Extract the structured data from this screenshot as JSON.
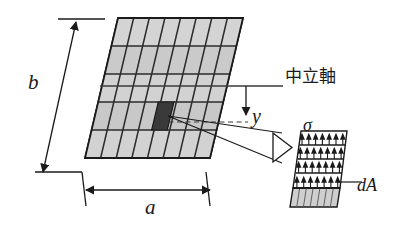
{
  "figure": {
    "labels": {
      "height_dim": "b",
      "width_dim": "a",
      "distance_from_axis": "y",
      "stress_symbol": "σ",
      "area_element": "dA",
      "neutral_axis": "中立軸"
    },
    "colors": {
      "line": "#1a1a1a",
      "grid_fill": "#c9c9c9",
      "grid_fill_light": "#d6d6d6",
      "highlight_cell": "#3a3a3a",
      "stress_band": "#cfcfcf",
      "background": "#ffffff"
    },
    "geometry": {
      "grid_columns": 8,
      "grid_rows": 5,
      "shear_offset_px": 33,
      "top_edge_y": 18,
      "bottom_edge_y": 158,
      "top_left_x": 118,
      "top_right_x": 243,
      "bottom_left_x": 85,
      "bottom_right_x": 210,
      "neutral_axis_y": 86,
      "highlight_col_index": 2,
      "highlight_row_index": 3
    },
    "stress_element": {
      "arrow_rows": 4,
      "arrows_per_row": 7,
      "description": "magnified sheared column showing tensile stress arrows acting on area dA"
    }
  }
}
